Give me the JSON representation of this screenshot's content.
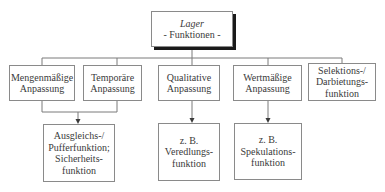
{
  "diagram": {
    "root": {
      "title": "Lager",
      "subtitle": "- Funktionen -"
    },
    "level2": [
      {
        "lines": [
          "Mengenmäßige",
          "Anpassung"
        ]
      },
      {
        "lines": [
          "Temporäre",
          "Anpassung"
        ]
      },
      {
        "lines": [
          "Qualitative",
          "Anpassung"
        ]
      },
      {
        "lines": [
          "Wertmäßige",
          "Anpassung"
        ]
      },
      {
        "lines": [
          "Selektions-/",
          "Darbietungs-",
          "funktion"
        ]
      }
    ],
    "level3": [
      {
        "lines": [
          "Ausgleichs-/",
          "Pufferfunktion;",
          "Sicherheits-",
          "funktion"
        ]
      },
      {
        "lines": [
          "z. B.",
          "Veredlungs-",
          "funktion"
        ]
      },
      {
        "lines": [
          "z. B.",
          "Spekulations-",
          "funktion"
        ]
      }
    ]
  },
  "colors": {
    "border": "#8a8a8a",
    "line": "#7a7a7a",
    "shadow": "#1a1a1a",
    "text": "#3a3a3a"
  }
}
